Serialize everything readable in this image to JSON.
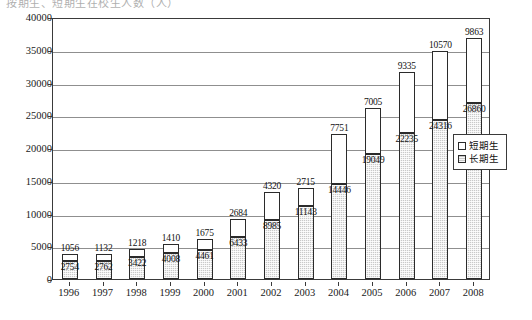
{
  "top_caption": "按期生、短期生在校生人数（人）",
  "legend": {
    "items": [
      {
        "label": "短期生",
        "key": "short",
        "color": "#ffffff"
      },
      {
        "label": "长期生",
        "key": "long",
        "color": "#c9c9c9"
      }
    ]
  },
  "chart_data": {
    "type": "bar",
    "stacked": true,
    "title": "",
    "subtitle": "",
    "xlabel": "",
    "ylabel": "",
    "ylim": [
      0,
      40000
    ],
    "ytick_step": 5000,
    "yticks": [
      "0",
      "5000",
      "10000",
      "15000",
      "20000",
      "25000",
      "30000",
      "35000",
      "40000"
    ],
    "ytick_values": [
      0,
      5000,
      10000,
      15000,
      20000,
      25000,
      30000,
      35000,
      40000
    ],
    "grid": true,
    "legend_position": "right",
    "categories": [
      "1996",
      "1997",
      "1998",
      "1999",
      "2000",
      "2001",
      "2002",
      "2003",
      "2004",
      "2005",
      "2006",
      "2007",
      "2008"
    ],
    "series": [
      {
        "name": "长期生",
        "key": "long",
        "stack_order": 0,
        "values": [
          2754,
          2762,
          3422,
          4008,
          4461,
          6433,
          8985,
          11143,
          14446,
          19049,
          22235,
          24316,
          26860
        ]
      },
      {
        "name": "短期生",
        "key": "short",
        "stack_order": 1,
        "values": [
          1056,
          1132,
          1218,
          1410,
          1675,
          2684,
          4320,
          2715,
          7751,
          7005,
          9335,
          10570,
          9863
        ]
      }
    ],
    "totals": [
      3810,
      3894,
      4640,
      5418,
      6136,
      9117,
      13305,
      13858,
      22197,
      26054,
      31570,
      34886,
      36723
    ]
  }
}
